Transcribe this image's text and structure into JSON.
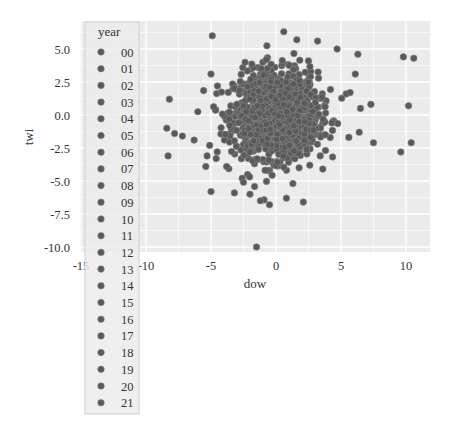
{
  "chart_data": {
    "type": "scatter",
    "title": "",
    "xlabel": "dow",
    "ylabel": "twi",
    "xlim": [
      -15.5,
      11.5
    ],
    "ylim": [
      -10.8,
      6.5
    ],
    "xticks": [
      -15,
      -10,
      -5,
      0,
      5,
      10
    ],
    "xtick_labels": [
      "-15",
      "-10",
      "-5",
      "0",
      "5",
      "10"
    ],
    "yticks": [
      5.0,
      2.5,
      0.0,
      -2.5,
      -5.0,
      -7.5,
      -10.0
    ],
    "ytick_labels": [
      "5.0",
      "2.5",
      "0.0",
      "-2.5",
      "-5.0",
      "-7.5",
      "-10.0"
    ],
    "grid": true,
    "background": "#ebebeb",
    "grid_color": "#ffffff",
    "marker_color": "#595959",
    "marker_edge": "#8a8a8a",
    "legend": {
      "title": "year",
      "position": "upper-left, overlapping plot",
      "entries": [
        "00",
        "01",
        "02",
        "03",
        "04",
        "05",
        "06",
        "07",
        "08",
        "09",
        "10",
        "11",
        "12",
        "13",
        "14",
        "15",
        "16",
        "17",
        "18",
        "19",
        "20",
        "21"
      ]
    },
    "cluster": {
      "description": "dense cloud of ~1500 points centered near origin",
      "center": [
        0.0,
        0.0
      ],
      "std": [
        1.6,
        1.6
      ],
      "count": 1400
    },
    "outliers": [
      [
        -4.9,
        6.0
      ],
      [
        -5.0,
        3.1
      ],
      [
        -4.5,
        2.2
      ],
      [
        -8.2,
        1.2
      ],
      [
        -8.4,
        -1.0
      ],
      [
        -7.8,
        -1.4
      ],
      [
        -7.2,
        -1.6
      ],
      [
        -6.3,
        -1.9
      ],
      [
        -8.3,
        -3.1
      ],
      [
        -5.1,
        -2.3
      ],
      [
        -5.3,
        -3.1
      ],
      [
        -5.4,
        -3.9
      ],
      [
        -4.6,
        -3.3
      ],
      [
        -5.0,
        -5.8
      ],
      [
        -3.2,
        -5.9
      ],
      [
        -2.0,
        -6.0
      ],
      [
        -1.2,
        -6.5
      ],
      [
        -0.5,
        -6.8
      ],
      [
        0.8,
        -6.3
      ],
      [
        -1.5,
        -10.0
      ],
      [
        -3.8,
        -3.9
      ],
      [
        -2.6,
        -4.8
      ],
      [
        1.3,
        -5.2
      ],
      [
        2.1,
        -6.6
      ],
      [
        0.6,
        6.3
      ],
      [
        1.6,
        5.7
      ],
      [
        3.2,
        5.6
      ],
      [
        4.7,
        5.0
      ],
      [
        6.1,
        3.1
      ],
      [
        6.3,
        4.6
      ],
      [
        6.5,
        0.5
      ],
      [
        7.3,
        0.8
      ],
      [
        5.4,
        1.6
      ],
      [
        5.7,
        1.7
      ],
      [
        9.8,
        4.4
      ],
      [
        10.6,
        4.3
      ],
      [
        10.2,
        0.7
      ],
      [
        10.4,
        -2.1
      ],
      [
        7.5,
        -2.1
      ],
      [
        9.6,
        -2.8
      ],
      [
        6.4,
        -1.3
      ],
      [
        5.6,
        -1.7
      ],
      [
        4.3,
        -0.6
      ],
      [
        3.8,
        -1.5
      ],
      [
        3.4,
        -3.1
      ],
      [
        2.6,
        -3.8
      ],
      [
        -2.5,
        -5.1
      ],
      [
        2.5,
        4.1
      ]
    ]
  }
}
